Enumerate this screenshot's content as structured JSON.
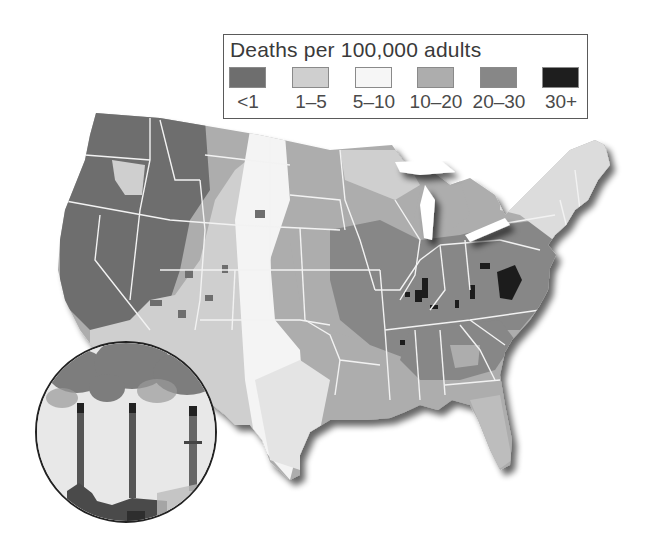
{
  "legend": {
    "title": "Deaths per 100,000 adults",
    "items": [
      {
        "label": "<1",
        "color": "#6e6e6e"
      },
      {
        "label": "1–5",
        "color": "#cfcfcf"
      },
      {
        "label": "5–10",
        "color": "#f6f6f6"
      },
      {
        "label": "10–20",
        "color": "#adadad"
      },
      {
        "label": "20–30",
        "color": "#878787"
      },
      {
        "label": "30+",
        "color": "#1e1e1e"
      }
    ]
  },
  "map": {
    "subject": "United States county-level map of deaths per 100,000 adults",
    "colors": {
      "lt1": "#6e6e6e",
      "c1_5": "#cfcfcf",
      "c5_10": "#f4f4f4",
      "c10_20": "#adadad",
      "c20_30": "#878787",
      "c30plus": "#1e1e1e",
      "border": "#f2f2f2",
      "shadow": "#555555"
    }
  },
  "inset_photo": {
    "subject": "power plant smokestacks emitting smoke",
    "icon": "smokestack-photo"
  }
}
